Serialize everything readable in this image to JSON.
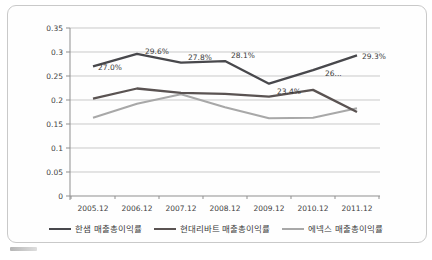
{
  "page": {
    "background": "#ffffff"
  },
  "chart_data": {
    "type": "line",
    "title": "",
    "categories": [
      "2005.12",
      "2006.12",
      "2007.12",
      "2008.12",
      "2009.12",
      "2010.12",
      "2011.12"
    ],
    "series": [
      {
        "name": "한샘 매출총이익률",
        "color": "#48484c",
        "values": [
          0.27,
          0.296,
          0.278,
          0.281,
          0.234,
          0.262,
          0.293
        ],
        "data_labels": [
          "27.0%",
          "29.6%",
          "27.8%",
          "28.1%",
          "23.4%",
          "26...",
          "29.3%"
        ]
      },
      {
        "name": "현대리바트 매출총이익률",
        "color": "#5a5352",
        "values": [
          0.203,
          0.224,
          0.215,
          0.213,
          0.207,
          0.221,
          0.175
        ],
        "data_labels": []
      },
      {
        "name": "에넥스 매출총이익률",
        "color": "#a8a8a8",
        "values": [
          0.163,
          0.192,
          0.212,
          0.185,
          0.162,
          0.163,
          0.183
        ],
        "data_labels": []
      }
    ],
    "y_axis": {
      "min": 0,
      "max": 0.35,
      "step": 0.05,
      "tick_labels": [
        "0",
        "0.05",
        "0.1",
        "0.15",
        "0.2",
        "0.25",
        "0.3",
        "0.35"
      ]
    },
    "x_axis": {
      "label": ""
    },
    "legend_position": "bottom",
    "grid": true,
    "axis_color": "#8f8f8f",
    "grid_color": "#c9c9c9",
    "label_color": "#3f3f3f"
  }
}
